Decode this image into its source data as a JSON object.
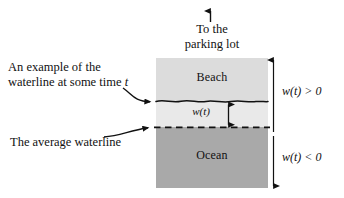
{
  "diagram": {
    "title_caption": {
      "line1": "To the",
      "line2": "parking lot"
    },
    "regions": {
      "beach_label": "Beach",
      "ocean_label": "Ocean",
      "beach_color": "#dcdcdc",
      "band_color": "#e9e9e9",
      "ocean_color": "#a9a9a9"
    },
    "measurements": {
      "inner_label": "w(t)",
      "positive_label": "w(t) > 0",
      "negative_label": "w(t) < 0"
    },
    "annotations": {
      "waterline_example": {
        "line1": "An example of the",
        "line2": "waterline at some time t"
      },
      "average_waterline": "The average waterline"
    },
    "line_color": "#111111"
  }
}
